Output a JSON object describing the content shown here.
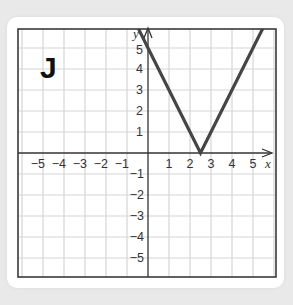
{
  "panel_label": "J",
  "axes": {
    "x_label": "x",
    "y_label": "y",
    "x_ticks_positive": [
      "1",
      "2",
      "3",
      "4",
      "5"
    ],
    "x_ticks_negative": [
      "−5",
      "−4",
      "−3",
      "−2",
      "−1"
    ],
    "y_ticks_positive": [
      "1",
      "2",
      "3",
      "4",
      "5"
    ],
    "y_ticks_negative": [
      "−1",
      "−2",
      "−3",
      "−4",
      "−5"
    ]
  },
  "colors": {
    "background": "#e9e9e9",
    "card": "#ffffff",
    "grid": "#d6d6d6",
    "axis": "#333333",
    "graph_line": "#454545"
  },
  "chart_data": {
    "type": "line",
    "title": "J",
    "xlabel": "x",
    "ylabel": "y",
    "xlim": [
      -6.2,
      6.1
    ],
    "ylim": [
      -5.9,
      5.9
    ],
    "grid": true,
    "x_ticks": [
      -5,
      -4,
      -3,
      -2,
      -1,
      1,
      2,
      3,
      4,
      5
    ],
    "y_ticks": [
      -5,
      -4,
      -3,
      -2,
      -1,
      1,
      2,
      3,
      4,
      5
    ],
    "function": "y = |2x - 5|",
    "series": [
      {
        "name": "graph",
        "x": [
          -0.45,
          0,
          1,
          2,
          2.5,
          3,
          4,
          5,
          5.5
        ],
        "y": [
          5.9,
          5,
          3,
          1,
          0,
          1,
          3,
          5,
          6
        ]
      }
    ],
    "vertex": [
      2.5,
      0
    ],
    "y_intercept": 5
  }
}
